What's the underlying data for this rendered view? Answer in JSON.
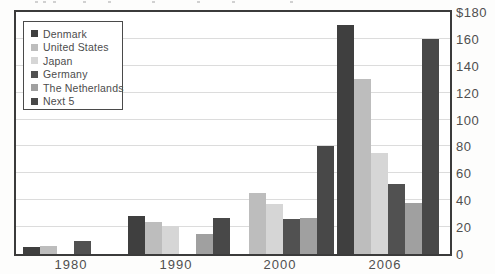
{
  "chart_data": {
    "type": "bar",
    "title": "",
    "categories": [
      "1980",
      "1990",
      "2000",
      "2006"
    ],
    "series": [
      {
        "name": "Denmark",
        "color": "#3f3f3f",
        "values": [
          5,
          28,
          null,
          170
        ]
      },
      {
        "name": "United States",
        "color": "#bdbdbd",
        "values": [
          6,
          24,
          45,
          130
        ]
      },
      {
        "name": "Japan",
        "color": "#d6d6d6",
        "values": [
          null,
          21,
          37,
          75
        ]
      },
      {
        "name": "Germany",
        "color": "#515151",
        "values": [
          10,
          null,
          26,
          52
        ]
      },
      {
        "name": "The Netherlands",
        "color": "#a0a0a0",
        "values": [
          null,
          15,
          27,
          38
        ]
      },
      {
        "name": "Next 5",
        "color": "#484848",
        "values": [
          null,
          27,
          80,
          160
        ]
      }
    ],
    "y_axis": {
      "side": "right",
      "min": 0,
      "max": 180,
      "tick_interval": 20,
      "tick_labels": [
        "$180",
        "160",
        "140",
        "120",
        "100",
        "80",
        "60",
        "40",
        "20",
        "0"
      ]
    },
    "grid": true,
    "legend_position": "top-left"
  }
}
